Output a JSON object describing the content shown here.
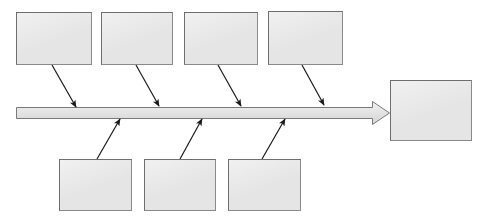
{
  "diagram": {
    "type": "fishbone-ishikawa-cause-and-effect",
    "title": "",
    "canvas": {
      "width": 484,
      "height": 222,
      "background": "#ffffff"
    },
    "colors": {
      "box_fill": "#e5e5e5",
      "box_border": "#6e6e6e",
      "spine_fill": "#e0e0e0",
      "spine_border": "#7a7a7a",
      "arrow_stroke": "#1a1a1a"
    },
    "spine": {
      "label": "",
      "x1": 16,
      "y1": 107,
      "x2": 390,
      "y2": 118,
      "direction": "left-to-right"
    },
    "cause_boxes_top": [
      {
        "label": "",
        "x": 16,
        "y": 12,
        "w": 76,
        "h": 53
      },
      {
        "label": "",
        "x": 101,
        "y": 12,
        "w": 72,
        "h": 53
      },
      {
        "label": "",
        "x": 184,
        "y": 12,
        "w": 74,
        "h": 53
      },
      {
        "label": "",
        "x": 268,
        "y": 11,
        "w": 75,
        "h": 54
      }
    ],
    "cause_boxes_bottom": [
      {
        "label": "",
        "x": 59,
        "y": 159,
        "w": 73,
        "h": 52
      },
      {
        "label": "",
        "x": 144,
        "y": 159,
        "w": 72,
        "h": 52
      },
      {
        "label": "",
        "x": 228,
        "y": 159,
        "w": 73,
        "h": 52
      }
    ],
    "effect_box": {
      "label": "",
      "x": 390,
      "y": 80,
      "w": 82,
      "h": 61
    },
    "connectors_top": [
      {
        "x1": 52,
        "y1": 65,
        "x2": 76,
        "y2": 108
      },
      {
        "x1": 136,
        "y1": 65,
        "x2": 159,
        "y2": 107
      },
      {
        "x1": 218,
        "y1": 65,
        "x2": 241,
        "y2": 107
      },
      {
        "x1": 302,
        "y1": 65,
        "x2": 324,
        "y2": 106
      }
    ],
    "connectors_bottom": [
      {
        "x1": 97,
        "y1": 159,
        "x2": 120,
        "y2": 118
      },
      {
        "x1": 180,
        "y1": 159,
        "x2": 202,
        "y2": 118
      },
      {
        "x1": 262,
        "y1": 159,
        "x2": 285,
        "y2": 118
      }
    ]
  }
}
